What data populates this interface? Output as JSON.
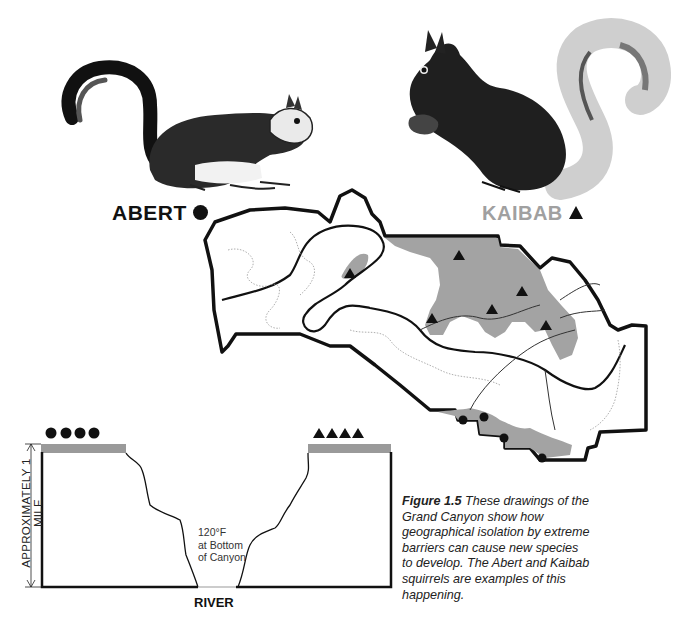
{
  "labels": {
    "abert": "ABERT",
    "kaibab": "KAIBAB"
  },
  "legend": {
    "abert_symbol": "circle",
    "kaibab_symbol": "triangle"
  },
  "cross_section": {
    "height_label": "APPROXIMATELY 1 MILE",
    "temperature_line1": "120°F",
    "temperature_line2": "at Bottom",
    "temperature_line3": "of Canyon",
    "river_label": "RIVER",
    "left_rim_markers": 4,
    "right_rim_markers": 4
  },
  "caption": {
    "figure_label": "Figure 1.5",
    "text": "These drawings of the Grand Canyon show how geographical isolation by extreme barriers can cause new species to develop. The Abert and Kaibab squirrels are examples of this happening."
  },
  "map": {
    "kaibab_markers": 7,
    "abert_markers": 4
  },
  "colors": {
    "range_fill": "#a3a3a3",
    "kaibab_label": "#a0a0a0",
    "ink": "#111111"
  }
}
